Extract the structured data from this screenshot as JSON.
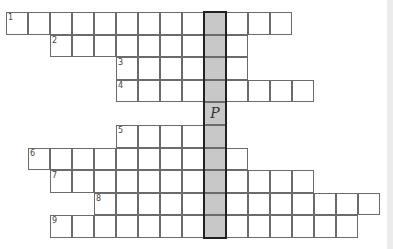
{
  "puzzle": {
    "type": "crossword",
    "cell_width": 22,
    "cell_height": 22.6,
    "origin_x": 6,
    "origin_y": 12,
    "highlight_col": 9,
    "highlight_color": "#c8c8c8",
    "rows": [
      {
        "row": 0,
        "clue": "1",
        "start_col": 0,
        "end_col": 12
      },
      {
        "row": 1,
        "clue": "2",
        "start_col": 2,
        "end_col": 10
      },
      {
        "row": 2,
        "clue": "3",
        "start_col": 5,
        "end_col": 10
      },
      {
        "row": 3,
        "clue": "4",
        "start_col": 5,
        "end_col": 13
      },
      {
        "row": 4,
        "clue": "",
        "start_col": 9,
        "end_col": 9
      },
      {
        "row": 5,
        "clue": "5",
        "start_col": 5,
        "end_col": 9
      },
      {
        "row": 6,
        "clue": "6",
        "start_col": 1,
        "end_col": 10
      },
      {
        "row": 7,
        "clue": "7",
        "start_col": 2,
        "end_col": 13
      },
      {
        "row": 8,
        "clue": "8",
        "start_col": 4,
        "end_col": 16
      },
      {
        "row": 9,
        "clue": "9",
        "start_col": 2,
        "end_col": 15
      }
    ],
    "filled_letters": [
      {
        "row": 4,
        "col": 9,
        "letter": "P"
      }
    ]
  }
}
